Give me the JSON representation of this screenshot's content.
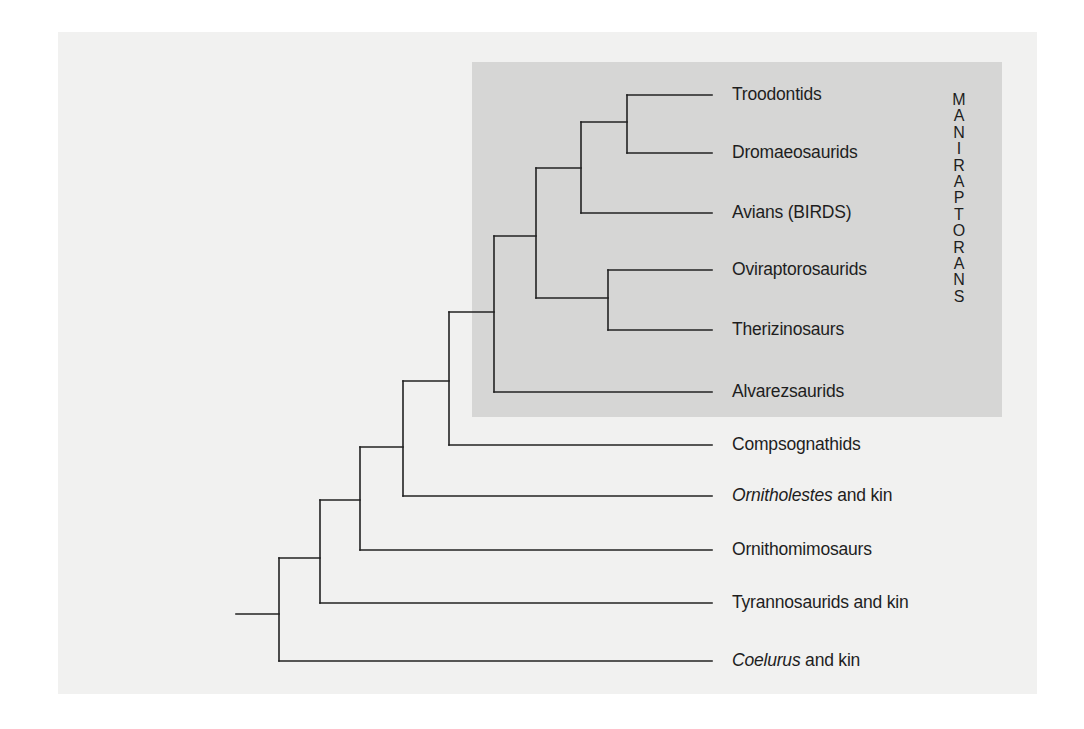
{
  "diagram": {
    "type": "cladogram",
    "clade_highlight": {
      "label": "MANIRAPTORANS",
      "letters": [
        "M",
        "A",
        "N",
        "I",
        "R",
        "A",
        "P",
        "T",
        "O",
        "R",
        "A",
        "N",
        "S"
      ],
      "fill_color": "#d6d6d5"
    },
    "background_color": "#f1f1f0",
    "line_color": "#222222",
    "leaves": [
      {
        "italic": "",
        "text": "Troodontids",
        "y": 95
      },
      {
        "italic": "",
        "text": "Dromaeosaurids",
        "y": 153
      },
      {
        "italic": "",
        "text": "Avians (BIRDS)",
        "y": 213
      },
      {
        "italic": "",
        "text": "Oviraptorosaurids",
        "y": 270
      },
      {
        "italic": "",
        "text": "Therizinosaurs",
        "y": 330
      },
      {
        "italic": "",
        "text": "Alvarezsaurids",
        "y": 392
      },
      {
        "italic": "",
        "text": "Compsognathids",
        "y": 445
      },
      {
        "italic": "Ornitholestes",
        "text": " and kin",
        "y": 496
      },
      {
        "italic": "",
        "text": "Ornithomimosaurs",
        "y": 550
      },
      {
        "italic": "",
        "text": "Tyrannosaurids and kin",
        "y": 603
      },
      {
        "italic": "Coelurus",
        "text": " and kin",
        "y": 661
      }
    ],
    "topology": "(Coelurus,(Tyrannosaurids,(Ornithomimosaurs,(Ornitholestes,(Compsognathids,(Alvarezsaurids,((Oviraptorosaurids,Therizinosaurs),(Avians,(Troodontids,Dromaeosaurids)))))))))"
  }
}
